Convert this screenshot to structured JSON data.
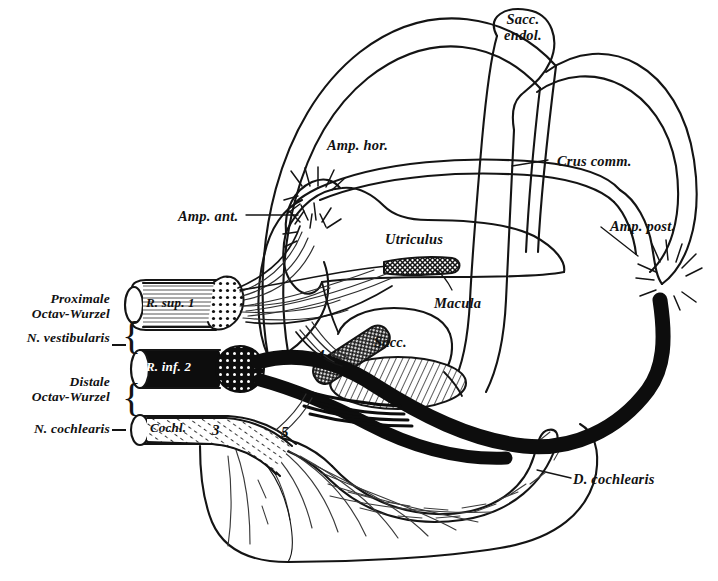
{
  "figure": {
    "background_color": "#ffffff",
    "ink_color": "#141414"
  },
  "structure_labels": [
    {
      "id": "sacc-endol",
      "text": "Sacc.\nendol.",
      "x": 510,
      "y": 18
    },
    {
      "id": "amp-hor",
      "text": "Amp. hor.",
      "x": 327,
      "y": 138
    },
    {
      "id": "crus-comm",
      "text": "Crus comm.",
      "x": 557,
      "y": 154
    },
    {
      "id": "amp-ant",
      "text": "Amp. ant.",
      "x": 178,
      "y": 209
    },
    {
      "id": "amp-post",
      "text": "Amp. post.",
      "x": 610,
      "y": 219
    },
    {
      "id": "utriculus",
      "text": "Utriculus",
      "x": 385,
      "y": 232
    },
    {
      "id": "macula",
      "text": "Macula",
      "x": 434,
      "y": 296
    },
    {
      "id": "sacc",
      "text": "Sacc.",
      "x": 374,
      "y": 335
    },
    {
      "id": "d-cochlearis",
      "text": "D. cochlearis",
      "x": 573,
      "y": 472
    }
  ],
  "root_labels": [
    {
      "id": "proximale-octav-wurzel",
      "line1": "Proximale",
      "line2": "Octav-Wurzel",
      "x": 46,
      "y": 295
    },
    {
      "id": "n-vestibularis",
      "line1": "N. vestibularis",
      "line2": "",
      "x": 10,
      "y": 338
    },
    {
      "id": "distale-octav-wurzel",
      "line1": "Distale",
      "line2": "Octav-Wurzel",
      "x": 52,
      "y": 380
    },
    {
      "id": "n-cochlearis",
      "line1": "N. cochlearis",
      "line2": "",
      "x": 10,
      "y": 423
    }
  ],
  "nerve_tube_labels": [
    {
      "id": "r-sup",
      "text": "R. sup. 1",
      "x": 146,
      "y": 300,
      "color": "#111111",
      "inverted": false
    },
    {
      "id": "r-inf",
      "text": "R. inf. 2",
      "x": 146,
      "y": 363,
      "color": "#ffffff",
      "inverted": true
    },
    {
      "id": "cochl",
      "text": "Cochl.",
      "x": 148,
      "y": 424,
      "color": "#111111",
      "inverted": false
    }
  ],
  "numeric_markers": [
    {
      "id": "marker-3",
      "text": "3",
      "x": 212,
      "y": 422
    },
    {
      "id": "marker-4",
      "text": "4",
      "x": 317,
      "y": 347
    },
    {
      "id": "marker-5",
      "text": "5",
      "x": 281,
      "y": 424
    }
  ],
  "braces": [
    {
      "id": "brace-vestibularis",
      "x": 113,
      "y": 310
    },
    {
      "id": "brace-cochlearis",
      "x": 113,
      "y": 378
    }
  ]
}
